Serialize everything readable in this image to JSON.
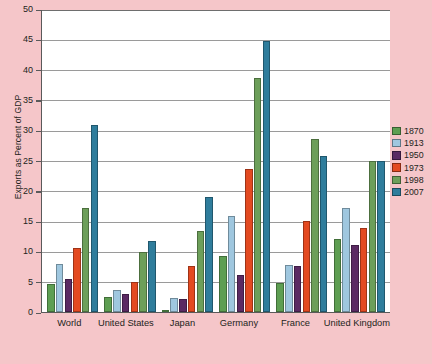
{
  "chart_data": {
    "type": "bar",
    "title": "",
    "xlabel": "",
    "ylabel": "Exports as Percent of GDP",
    "ylim": [
      0,
      50
    ],
    "ytick_step": 5,
    "yticks": [
      50,
      45,
      40,
      35,
      30,
      25,
      20,
      15,
      10,
      5,
      0
    ],
    "grid": true,
    "legend_position": "right",
    "categories": [
      "World",
      "United States",
      "Japan",
      "Germany",
      "France",
      "United Kingdom"
    ],
    "series": [
      {
        "name": "1870",
        "color": "#5e9e52",
        "values": [
          4.6,
          2.5,
          0.2,
          9.3,
          4.8,
          12.0
        ]
      },
      {
        "name": "1913",
        "color": "#9fc7df",
        "values": [
          7.9,
          3.7,
          2.3,
          15.9,
          7.7,
          17.2
        ]
      },
      {
        "name": "1950",
        "color": "#5b2a63",
        "values": [
          5.5,
          2.9,
          2.1,
          6.1,
          7.6,
          11.0
        ]
      },
      {
        "name": "1973",
        "color": "#e34a21",
        "values": [
          10.5,
          4.9,
          7.6,
          23.6,
          15.0,
          13.8
        ]
      },
      {
        "name": "1998",
        "color": "#6d9f5a",
        "values": [
          17.2,
          9.9,
          13.4,
          38.6,
          28.5,
          24.9
        ]
      },
      {
        "name": "2007",
        "color": "#2f7d9c",
        "values": [
          30.8,
          11.8,
          18.9,
          44.8,
          25.8,
          24.9
        ]
      }
    ]
  },
  "legend": {
    "entries": [
      {
        "label": "1870",
        "color": "#5e9e52"
      },
      {
        "label": "1913",
        "color": "#9fc7df"
      },
      {
        "label": "1950",
        "color": "#5b2a63"
      },
      {
        "label": "1973",
        "color": "#e34a21"
      },
      {
        "label": "1998",
        "color": "#6d9f5a"
      },
      {
        "label": "2007",
        "color": "#2f7d9c"
      }
    ]
  },
  "colors": {
    "background": "#f5c6c9",
    "plot_background": "#ffffff",
    "axis": "#5a5a5a",
    "gridline": "#9a9a9a",
    "text": "#231f20"
  }
}
